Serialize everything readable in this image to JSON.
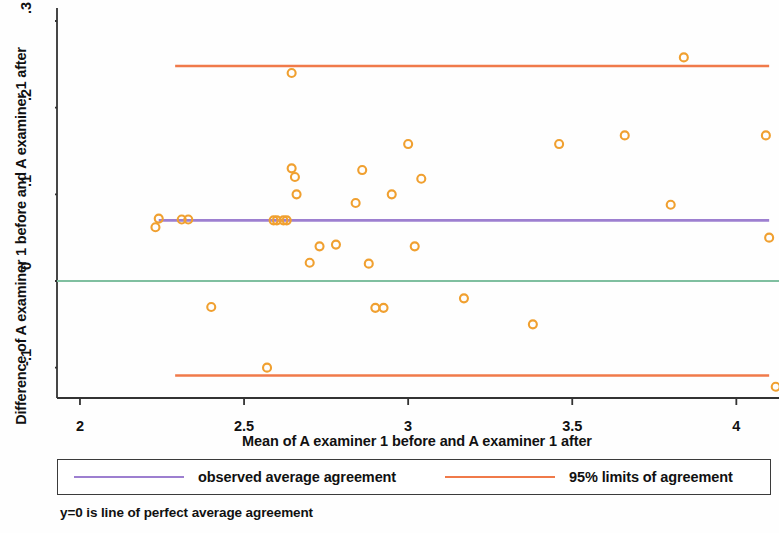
{
  "chart_data": {
    "type": "scatter",
    "title": "",
    "xlabel": "Mean of A examiner 1 before and A examiner 1 after",
    "ylabel": "Difference of A examiner 1 before and A examiner 1 after",
    "xlim": [
      1.93,
      4.13
    ],
    "ylim": [
      -0.135,
      0.315
    ],
    "xticks": [
      2,
      2.5,
      3,
      3.5,
      4
    ],
    "xticklabels": [
      "2",
      "2.5",
      "3",
      "3.5",
      "4"
    ],
    "yticks": [
      -0.1,
      0,
      0.1,
      0.2,
      0.3
    ],
    "yticklabels": [
      "-.1",
      "0",
      ".1",
      ".2",
      ".3"
    ],
    "grid": false,
    "marker": "open-circle",
    "marker_color": "#f0a030",
    "points": [
      {
        "x": 2.23,
        "y": 0.062
      },
      {
        "x": 2.24,
        "y": 0.072
      },
      {
        "x": 2.31,
        "y": 0.071
      },
      {
        "x": 2.33,
        "y": 0.071
      },
      {
        "x": 2.4,
        "y": -0.03
      },
      {
        "x": 2.57,
        "y": -0.1
      },
      {
        "x": 2.59,
        "y": 0.07
      },
      {
        "x": 2.6,
        "y": 0.07
      },
      {
        "x": 2.62,
        "y": 0.07
      },
      {
        "x": 2.63,
        "y": 0.07
      },
      {
        "x": 2.645,
        "y": 0.24
      },
      {
        "x": 2.645,
        "y": 0.13
      },
      {
        "x": 2.655,
        "y": 0.12
      },
      {
        "x": 2.66,
        "y": 0.1
      },
      {
        "x": 2.7,
        "y": 0.021
      },
      {
        "x": 2.73,
        "y": 0.04
      },
      {
        "x": 2.78,
        "y": 0.042
      },
      {
        "x": 2.84,
        "y": 0.09
      },
      {
        "x": 2.86,
        "y": 0.128
      },
      {
        "x": 2.88,
        "y": 0.02
      },
      {
        "x": 2.9,
        "y": -0.031
      },
      {
        "x": 2.925,
        "y": -0.031
      },
      {
        "x": 2.95,
        "y": 0.1
      },
      {
        "x": 3.0,
        "y": 0.158
      },
      {
        "x": 3.02,
        "y": 0.04
      },
      {
        "x": 3.04,
        "y": 0.118
      },
      {
        "x": 3.17,
        "y": -0.02
      },
      {
        "x": 3.38,
        "y": -0.05
      },
      {
        "x": 3.46,
        "y": 0.158
      },
      {
        "x": 3.66,
        "y": 0.168
      },
      {
        "x": 3.8,
        "y": 0.088
      },
      {
        "x": 3.84,
        "y": 0.258
      },
      {
        "x": 4.09,
        "y": 0.168
      },
      {
        "x": 4.1,
        "y": 0.05
      },
      {
        "x": 4.12,
        "y": -0.122
      }
    ],
    "reference_lines": [
      {
        "name": "upper-limit-of-agreement",
        "value": 0.248,
        "color": "#f07a4a",
        "x_start": 2.29,
        "x_end": 4.1
      },
      {
        "name": "observed-average-agreement",
        "value": 0.07,
        "color": "#9d7fd0",
        "x_start": 2.24,
        "x_end": 4.1
      },
      {
        "name": "zero-perfect-agreement",
        "value": 0.0,
        "color": "#7fbfa0",
        "x_start": 1.93,
        "x_end": 4.13
      },
      {
        "name": "lower-limit-of-agreement",
        "value": -0.109,
        "color": "#f07a4a",
        "x_start": 2.29,
        "x_end": 4.1
      }
    ]
  },
  "legend": {
    "position": "below-axes",
    "items": [
      {
        "label": "observed average agreement",
        "color": "#9d7fd0"
      },
      {
        "label": "95% limits of agreement",
        "color": "#f07a4a"
      }
    ]
  },
  "caption": "y=0 is line of perfect average agreement"
}
